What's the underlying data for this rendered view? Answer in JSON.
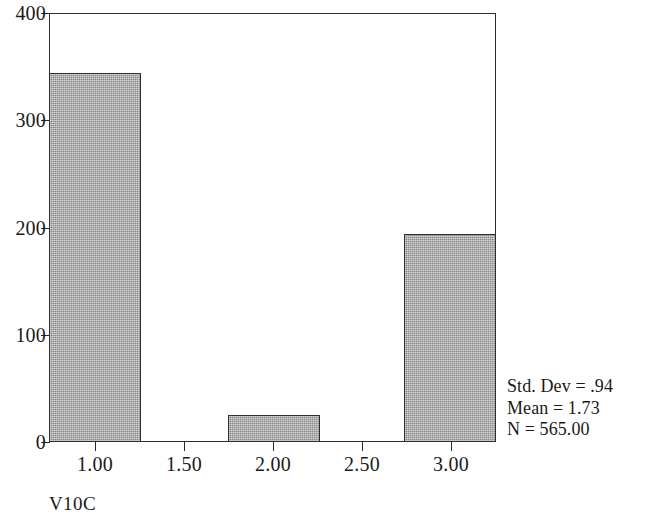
{
  "chart_data": {
    "type": "bar",
    "title": "",
    "subtitle": "",
    "xlabel": "V10C",
    "ylabel": "",
    "categories": [
      "1.00",
      "2.00",
      "3.00"
    ],
    "values": [
      344,
      25,
      194
    ],
    "x": [
      1.0,
      2.0,
      3.0
    ],
    "xlim": [
      0.75,
      3.25
    ],
    "ylim": [
      0,
      400
    ],
    "xticks": [
      "1.00",
      "1.50",
      "2.00",
      "2.50",
      "3.00"
    ],
    "xtick_values": [
      1.0,
      1.5,
      2.0,
      2.5,
      3.0
    ],
    "yticks": [
      "0",
      "100",
      "200",
      "300",
      "400"
    ],
    "ytick_values": [
      0,
      100,
      200,
      300,
      400
    ],
    "grid": false,
    "legend": "none",
    "bar_fill_color": "#a9a9a9",
    "bar_edge_color": "#2f2f2f",
    "axis_color": "#2b2b2b",
    "background_color": "#ffffff",
    "annotations": [
      "Std. Dev = .94",
      "Mean = 1.73",
      "N = 565.00"
    ]
  },
  "axes": {
    "y_labels": [
      "400",
      "300",
      "200",
      "100",
      "0"
    ],
    "y_values": [
      400,
      300,
      200,
      100,
      0
    ],
    "x_labels": [
      "1.00",
      "1.50",
      "2.00",
      "2.50",
      "3.00"
    ],
    "x_values": [
      1.0,
      1.5,
      2.0,
      2.5,
      3.0
    ],
    "x_title": "V10C"
  },
  "stats": {
    "std_dev": "Std. Dev = .94",
    "mean": "Mean = 1.73",
    "n": "N = 565.00"
  },
  "bars": [
    {
      "label": "1.00",
      "value": 344
    },
    {
      "label": "2.00",
      "value": 25
    },
    {
      "label": "3.00",
      "value": 194
    }
  ]
}
